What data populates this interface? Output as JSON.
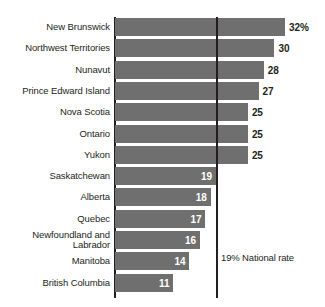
{
  "chart_data": {
    "type": "bar",
    "orientation": "horizontal",
    "title": "",
    "xlabel": "",
    "ylabel": "",
    "xlim": [
      0,
      34
    ],
    "grid": false,
    "legend": null,
    "unit": "%",
    "categories": [
      "New Brunswick",
      "Northwest Territories",
      "Nunavut",
      "Prince Edward Island",
      "Nova Scotia",
      "Ontario",
      "Yukon",
      "Saskatchewan",
      "Alberta",
      "Quebec",
      "Newfoundland and\nLabrador",
      "Manitoba",
      "British Columbia"
    ],
    "values": [
      32,
      30,
      28,
      27,
      25,
      25,
      25,
      19,
      18,
      17,
      16,
      14,
      11
    ],
    "value_labels": [
      "32%",
      "30",
      "28",
      "27",
      "25",
      "25",
      "25",
      "19",
      "18",
      "17",
      "16",
      "14",
      "11"
    ],
    "label_placement": [
      "outside",
      "outside",
      "outside",
      "outside",
      "outside",
      "outside",
      "outside",
      "inside",
      "inside",
      "inside",
      "inside",
      "inside",
      "inside"
    ],
    "reference_line": {
      "value": 19,
      "label": "19% National rate"
    },
    "colors": {
      "bar": "#6f6f6f",
      "axis": "#231f20",
      "text": "#231f20",
      "inside_label": "#ffffff",
      "background": "#ffffff"
    }
  }
}
